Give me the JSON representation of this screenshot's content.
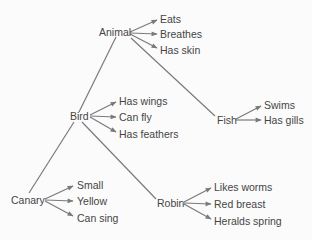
{
  "colors": {
    "background": "#fbfbfb",
    "text": "#454545",
    "line": "#7a7a7a"
  },
  "nodes": {
    "animal": {
      "label": "Animal",
      "properties": [
        "Eats",
        "Breathes",
        "Has skin"
      ]
    },
    "bird": {
      "label": "Bird",
      "properties": [
        "Has wings",
        "Can fly",
        "Has feathers"
      ]
    },
    "fish": {
      "label": "Fish",
      "properties": [
        "Swims",
        "Has gills"
      ]
    },
    "canary": {
      "label": "Canary",
      "properties": [
        "Small",
        "Yellow",
        "Can sing"
      ]
    },
    "robin": {
      "label": "Robin",
      "properties": [
        "Likes worms",
        "Red breast",
        "Heralds spring"
      ]
    }
  },
  "hierarchy": [
    {
      "from": "Animal",
      "to": "Bird"
    },
    {
      "from": "Animal",
      "to": "Fish"
    },
    {
      "from": "Bird",
      "to": "Canary"
    },
    {
      "from": "Bird",
      "to": "Robin"
    }
  ]
}
